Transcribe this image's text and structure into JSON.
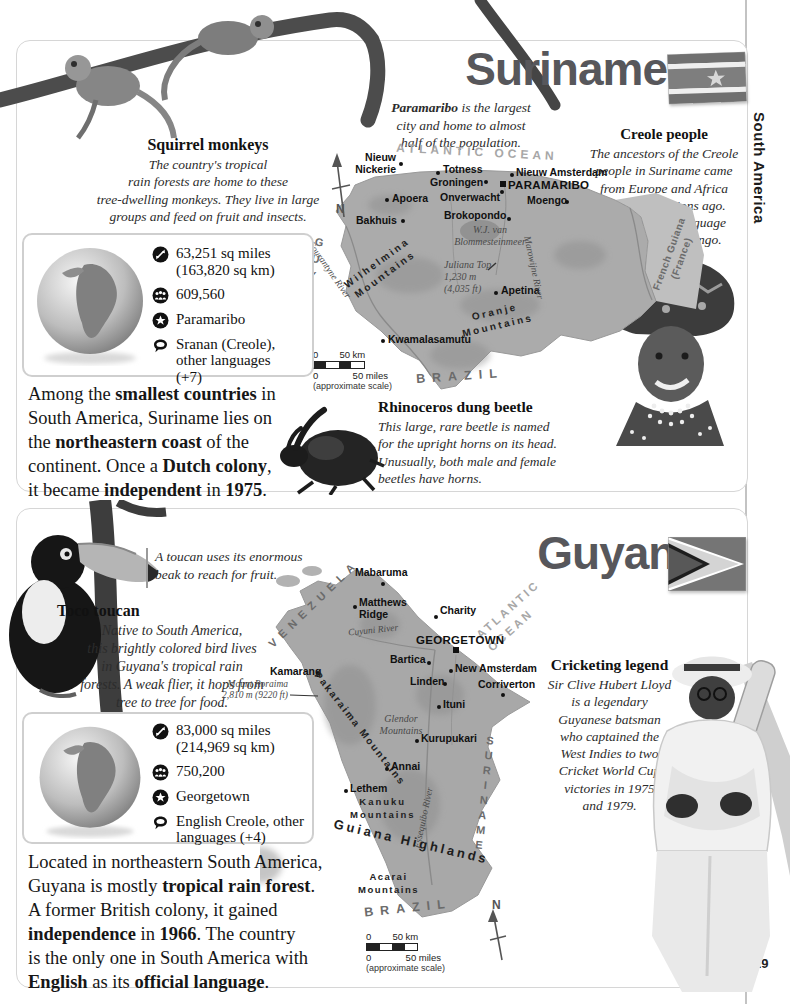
{
  "page": {
    "number": "29",
    "edge_tab": "South America"
  },
  "icons": {
    "area": "area-arrows-icon",
    "population": "population-people-icon",
    "capital": "capital-star-icon",
    "language": "speech-bubble-icon",
    "compass": "north-compass-icon"
  },
  "suriname": {
    "title": "Suriname",
    "monkeys": {
      "heading": "Squirrel monkeys",
      "body": "The country's tropical\nrain forests are home to these\ntree-dwelling monkeys. They live in large\ngroups and feed on fruit and insects."
    },
    "capital_caption": [
      {
        "t": "Paramaribo",
        "b": true
      },
      {
        "t": " is the largest\ncity and home to almost\nhalf of the population.",
        "b": false
      }
    ],
    "creole": {
      "heading": "Creole people",
      "body": "The ancestors of the Creole\npeople in Suriname came\nfrom Europe and Africa\nmany generations ago.\nThey speak a language\ncalled Sranan Tongo."
    },
    "stats": {
      "area": "63,251 sq miles\n(163,820 sq km)",
      "population": "609,560",
      "capital": "Paramaribo",
      "languages": "Sranan (Creole),\nother languages\n(+7)"
    },
    "summary": [
      {
        "t": "Among the ",
        "b": false
      },
      {
        "t": "smallest countries",
        "b": true
      },
      {
        "t": " in\nSouth America, Suriname lies on\nthe ",
        "b": false
      },
      {
        "t": "northeastern coast",
        "b": true
      },
      {
        "t": " of the\ncontinent. Once a ",
        "b": false
      },
      {
        "t": "Dutch colony",
        "b": true
      },
      {
        "t": ",\nit became ",
        "b": false
      },
      {
        "t": "independent",
        "b": true
      },
      {
        "t": " in ",
        "b": false
      },
      {
        "t": "1975",
        "b": true
      },
      {
        "t": ".",
        "b": false
      }
    ],
    "beetle": {
      "heading": "Rhinoceros dung beetle",
      "body": "This large, rare beetle is named\nfor the upright horns on its head.\nUnusually, both male and female\nbeetles have horns."
    },
    "map": {
      "ocean": "ATLANTIC OCEAN",
      "compass": "N",
      "cities": {
        "nieuw_nickerie": "Nieuw\nNickerie",
        "totness": "Totness",
        "groningen": "Groningen",
        "nieuw_amsterdam": "Nieuw Amsterdam",
        "paramaribo": "PARAMARIBO",
        "moengo": "Moengo",
        "apoera": "Apoera",
        "onverwacht": "Onverwacht",
        "bakhuis": "Bakhuis",
        "brokopondo": "Brokopondo",
        "apetina": "Apetina",
        "kwamalasamutu": "Kwamalasamutu"
      },
      "lake": "W.J. van\nBlommesteinmeer",
      "peak": "Juliana Top\n1,230 m\n(4,035 ft)",
      "wilhelmina": "Wilhelmina\nMountains",
      "oranje": "Oranje\nMountains",
      "courantyne": "Courantyne River",
      "marowijne": "Marowijne River",
      "guyana": "GUYANA",
      "french_guiana": "French Guiana\n(France)",
      "brazil": "BRAZIL",
      "scale_km": "0        50 km",
      "scale_miles": "0             50 miles",
      "scale_note": "(approximate scale)"
    }
  },
  "guyana": {
    "title": "Guyana",
    "toucan_caption": "A toucan uses its enormous\nbeak to reach for fruit.",
    "toucan": {
      "heading": "Toco toucan",
      "body": "Native to South America,\nthis brightly colored bird lives\nin Guyana's tropical rain\nforests. A weak flier, it hops from\ntree to tree for food."
    },
    "cricket": {
      "heading": "Cricketing legend",
      "body": "Sir Clive Hubert Lloyd\nis a legendary\nGuyanese batsman\nwho captained the\nWest Indies to two\nCricket World Cup\nvictories in 1975\nand 1979."
    },
    "stats": {
      "area": "83,000 sq miles\n(214,969 sq km)",
      "population": "750,200",
      "capital": "Georgetown",
      "languages": "English Creole, other\nlanguages (+4)"
    },
    "summary": [
      {
        "t": "Located in northeastern South America,\nGuyana is mostly ",
        "b": false
      },
      {
        "t": "tropical rain forest",
        "b": true
      },
      {
        "t": ".\nA former British colony, it gained\n",
        "b": false
      },
      {
        "t": "independence",
        "b": true
      },
      {
        "t": " in ",
        "b": false
      },
      {
        "t": "1966",
        "b": true
      },
      {
        "t": ". The country\nis the only one in South America with\n",
        "b": false
      },
      {
        "t": "English",
        "b": true
      },
      {
        "t": " as its ",
        "b": false
      },
      {
        "t": "official language",
        "b": true
      },
      {
        "t": ".",
        "b": false
      }
    ],
    "map": {
      "ocean": "ATLANTIC\nOCEAN",
      "compass": "N",
      "venezuela": "VENEZUELA",
      "suriname": "SURINAME",
      "brazil": "BRAZIL",
      "cities": {
        "mabaruma": "Mabaruma",
        "matthews_ridge": "Matthews\nRidge",
        "charity": "Charity",
        "georgetown": "GEORGETOWN",
        "bartica": "Bartica",
        "new_amsterdam": "New Amsterdam",
        "linden": "Linden",
        "corriverton": "Corriverton",
        "ituni": "Ituni",
        "kurupukari": "Kurupukari",
        "annai": "Annai",
        "lethem": "Lethem",
        "kamarang": "Kamarang"
      },
      "cuyuni": "Cuyuni River",
      "essequibo": "Essequibo River",
      "roraima": "Mount Roraima\n2,810 m (9220 ft)",
      "pakaraima": "Pakaraima Mountains",
      "glendor": "Glendor\nMountains",
      "kanuku": "Kanuku\nMountains",
      "acarai": "Acarai\nMountains",
      "highlands": "Guiana Highlands",
      "scale_km": "0        50 km",
      "scale_miles": "0             50 miles",
      "scale_note": "(approximate scale)"
    }
  }
}
